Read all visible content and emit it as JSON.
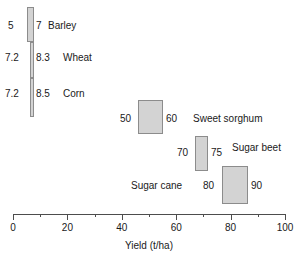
{
  "chart_data": {
    "type": "bar",
    "title": "",
    "subtitle": "",
    "xlabel": "Yield (t/ha)",
    "ylabel": "",
    "xlim": [
      0,
      100
    ],
    "xticks": [
      0,
      20,
      40,
      60,
      80,
      100
    ],
    "xticklabels": [
      "0",
      "20",
      "40",
      "60",
      "80",
      "100"
    ],
    "minor_xticks": [
      10,
      30,
      50,
      70,
      90
    ],
    "grid": false,
    "legend": false,
    "orientation": "horizontal",
    "note": "Horizontal range (floating) bars: each box spans the crop's minimum to maximum yield in t/ha; endpoint values are printed at the left and right edge of each box and the crop name is printed beside it.",
    "categories": [
      "Barley",
      "Wheat",
      "Corn",
      "Sweet sorghum",
      "Sugar beet",
      "Sugar cane"
    ],
    "series": [
      {
        "name": "low",
        "values": [
          5,
          7.2,
          7.2,
          50,
          70,
          80
        ]
      },
      {
        "name": "high",
        "values": [
          7,
          8.3,
          8.5,
          60,
          75,
          90
        ]
      }
    ],
    "ranges": [
      {
        "label": "Barley",
        "low": 5,
        "high": 7,
        "low_text": "5",
        "high_text": "7",
        "name_side": "right"
      },
      {
        "label": "Wheat",
        "low": 7.2,
        "high": 8.3,
        "low_text": "7.2",
        "high_text": "8.3",
        "name_side": "right"
      },
      {
        "label": "Corn",
        "low": 7.2,
        "high": 8.5,
        "low_text": "7.2",
        "high_text": "8.5",
        "name_side": "right"
      },
      {
        "label": "Sweet sorghum",
        "low": 50,
        "high": 60,
        "low_text": "50",
        "high_text": "60",
        "name_side": "right"
      },
      {
        "label": "Sugar beet",
        "low": 70,
        "high": 75,
        "low_text": "70",
        "high_text": "75",
        "name_side": "right"
      },
      {
        "label": "Sugar cane",
        "low": 80,
        "high": 90,
        "low_text": "80",
        "high_text": "90",
        "name_side": "left"
      }
    ],
    "colors": {
      "box_fill": "#d3d3d3",
      "box_stroke": "#8c8c8c",
      "axis": "#4d4d4d",
      "text": "#1a1a1a",
      "background": "#ffffff"
    }
  },
  "boxes": [
    {
      "id": "barley",
      "left": 27,
      "top": 7,
      "width": 7,
      "height": 35
    },
    {
      "id": "wheat",
      "left": 30,
      "top": 42,
      "width": 4,
      "height": 36
    },
    {
      "id": "corn",
      "left": 30,
      "top": 78,
      "width": 4,
      "height": 39
    },
    {
      "id": "sweetsorghum",
      "left": 138,
      "top": 100,
      "width": 25,
      "height": 34
    },
    {
      "id": "sugarbeet",
      "left": 195,
      "top": 136,
      "width": 13,
      "height": 35
    },
    {
      "id": "sugarcane",
      "left": 222,
      "top": 166,
      "width": 26,
      "height": 38
    }
  ],
  "labels": [
    {
      "id": "barley-low",
      "text": "5",
      "left": 8,
      "top": 20
    },
    {
      "id": "barley-high",
      "text": "7",
      "left": 36,
      "top": 20
    },
    {
      "id": "barley-name",
      "text": "Barley",
      "left": 48,
      "top": 20
    },
    {
      "id": "wheat-low",
      "text": "7.2",
      "left": 5,
      "top": 52
    },
    {
      "id": "wheat-high",
      "text": "8.3",
      "left": 36,
      "top": 52
    },
    {
      "id": "wheat-name",
      "text": "Wheat",
      "left": 63,
      "top": 52
    },
    {
      "id": "corn-low",
      "text": "7.2",
      "left": 5,
      "top": 88
    },
    {
      "id": "corn-high",
      "text": "8.5",
      "left": 36,
      "top": 88
    },
    {
      "id": "corn-name",
      "text": "Corn",
      "left": 63,
      "top": 88
    },
    {
      "id": "ss-low",
      "text": "50",
      "left": 120,
      "top": 113
    },
    {
      "id": "ss-high",
      "text": "60",
      "left": 166,
      "top": 113
    },
    {
      "id": "ss-name",
      "text": "Sweet sorghum",
      "left": 193,
      "top": 113
    },
    {
      "id": "sb-low",
      "text": "70",
      "left": 177,
      "top": 147
    },
    {
      "id": "sb-high",
      "text": "75",
      "left": 211,
      "top": 147
    },
    {
      "id": "sb-name",
      "text": "Sugar beet",
      "left": 232,
      "top": 142
    },
    {
      "id": "sc-low",
      "text": "80",
      "left": 203,
      "top": 180
    },
    {
      "id": "sc-high",
      "text": "90",
      "left": 251,
      "top": 180
    },
    {
      "id": "sc-name",
      "text": "Sugar cane",
      "left": 131,
      "top": 180
    }
  ],
  "axis": {
    "title": "Yield (t/ha)",
    "ticks": [
      {
        "value": 0,
        "label": "0",
        "type": "major"
      },
      {
        "value": 10,
        "label": "",
        "type": "minor"
      },
      {
        "value": 20,
        "label": "20",
        "type": "major"
      },
      {
        "value": 30,
        "label": "",
        "type": "minor"
      },
      {
        "value": 40,
        "label": "40",
        "type": "major"
      },
      {
        "value": 50,
        "label": "",
        "type": "minor"
      },
      {
        "value": 60,
        "label": "60",
        "type": "major"
      },
      {
        "value": 70,
        "label": "",
        "type": "minor"
      },
      {
        "value": 80,
        "label": "80",
        "type": "major"
      },
      {
        "value": 90,
        "label": "",
        "type": "minor"
      },
      {
        "value": 100,
        "label": "100",
        "type": "major"
      }
    ]
  }
}
